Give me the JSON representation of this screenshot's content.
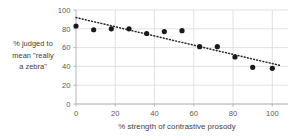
{
  "chart_data": {
    "type": "scatter",
    "title": "",
    "subtitle": "",
    "xlabel": "%  strength of contrastive prosody",
    "ylabel_lines": [
      "% judged to",
      "mean \"really",
      "a zebra\""
    ],
    "ylabel": "% judged to mean \"really a zebra\"",
    "xlim": [
      0,
      108
    ],
    "ylim": [
      0,
      100
    ],
    "xticks": [
      0,
      20,
      40,
      60,
      80,
      100
    ],
    "yticks": [
      0,
      20,
      40,
      60,
      80,
      100
    ],
    "grid": true,
    "grid_color": "#d9d9d9",
    "legend": null,
    "marker": {
      "shape": "circle",
      "color": "#1a1a1a",
      "size_px": 5.2
    },
    "points": [
      {
        "x": 0,
        "y": 83
      },
      {
        "x": 9,
        "y": 79
      },
      {
        "x": 18,
        "y": 80
      },
      {
        "x": 27,
        "y": 80
      },
      {
        "x": 36,
        "y": 75
      },
      {
        "x": 45,
        "y": 77
      },
      {
        "x": 54,
        "y": 78
      },
      {
        "x": 63,
        "y": 61
      },
      {
        "x": 72,
        "y": 61
      },
      {
        "x": 81,
        "y": 50
      },
      {
        "x": 90,
        "y": 39
      },
      {
        "x": 100,
        "y": 38
      }
    ],
    "trendline": {
      "type": "linear",
      "style": "dotted",
      "color": "#262626",
      "x_start": 0,
      "y_start": 92,
      "x_end": 104,
      "y_end": 41
    }
  }
}
